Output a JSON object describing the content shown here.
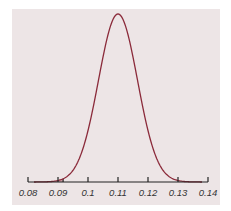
{
  "colors": {
    "background": "#ede5e6",
    "curve": "#8b2a3a",
    "shade": "#c9909a",
    "axis": "#222222"
  },
  "chart_data": {
    "type": "area",
    "title": "",
    "xlabel": "",
    "ylabel": "",
    "distribution": "normal",
    "mean": 0.11,
    "sd": 0.0065,
    "xlim": [
      0.08,
      0.14
    ],
    "x_ticks": [
      0.08,
      0.09,
      0.1,
      0.11,
      0.12,
      0.13,
      0.14
    ],
    "x_tick_labels": [
      "0.08",
      "0.09",
      "0.1",
      "0.11",
      "0.12",
      "0.13",
      "0.14"
    ],
    "shaded_region": {
      "from": 0.08,
      "to": 0.0917,
      "description": "left tail area"
    },
    "grid": false,
    "legend": null
  }
}
